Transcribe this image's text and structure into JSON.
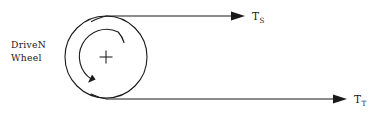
{
  "diagram": {
    "background_color": "#ffffff",
    "ink_color": "#1a1a1a",
    "wheel": {
      "label_line1": "DriveN",
      "label_line2": "Wheel",
      "center_x": 106,
      "center_y": 57,
      "outer_radius": 41,
      "inner_arc_radius": 27,
      "center_marker": "plus-mark",
      "rotation_direction": "counterclockwise"
    },
    "belts": [
      {
        "id": "slack-side",
        "symbol": "T",
        "subscript": "S",
        "position": "top",
        "y": 16,
        "start_x": 107,
        "arrow_tip_x": 245,
        "label_x": 252,
        "label_y": 20
      },
      {
        "id": "tight-side",
        "symbol": "T",
        "subscript": "T",
        "position": "bottom",
        "y": 99,
        "start_x": 107,
        "arrow_tip_x": 347,
        "label_x": 354,
        "label_y": 103
      }
    ]
  }
}
